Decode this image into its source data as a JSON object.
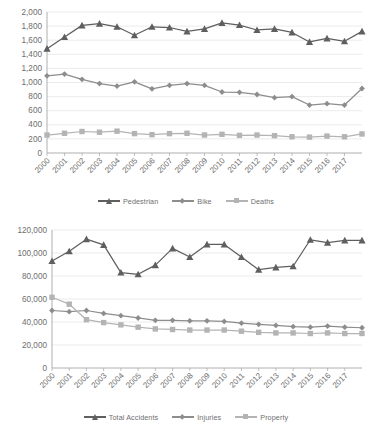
{
  "colors": {
    "series_dark": "#5f5f5f",
    "series_mid": "#8d8d8d",
    "series_light": "#b4b4b4",
    "axis": "#a6a6a6",
    "grid": "#e3e3e3",
    "text": "#6e6e6e",
    "background": "#ffffff"
  },
  "chart_data": [
    {
      "id": "traffic-fatalities-chart",
      "type": "line",
      "title": "",
      "xlabel": "",
      "ylabel": "",
      "grid": true,
      "legend_position": "bottom",
      "ylim": [
        0,
        2000
      ],
      "yticks": [
        0,
        200,
        400,
        600,
        800,
        1000,
        1200,
        1400,
        1600,
        1800,
        2000
      ],
      "ytick_labels": [
        "0",
        "200",
        "400",
        "600",
        "800",
        "1,000",
        "1,200",
        "1,400",
        "1,600",
        "1,800",
        "2,000"
      ],
      "categories": [
        "2000",
        "2001",
        "2002",
        "2003",
        "2004",
        "2005",
        "2006",
        "2007",
        "2008",
        "2009",
        "2010",
        "2011",
        "2012",
        "2013",
        "2014",
        "2015",
        "2016",
        "2017",
        ""
      ],
      "tick_labels": [
        "2000",
        "2001",
        "2002",
        "2003",
        "2004",
        "2005",
        "2006",
        "2007",
        "2008",
        "2009",
        "2010",
        "2011",
        "2012",
        "2013",
        "2014",
        "2015",
        "2016",
        "2017"
      ],
      "series": [
        {
          "name": "Pedestrian",
          "marker": "triangle",
          "color": "#5f5f5f",
          "values": [
            1480,
            1645,
            1810,
            1835,
            1790,
            1670,
            1790,
            1780,
            1725,
            1760,
            1845,
            1815,
            1745,
            1760,
            1710,
            1575,
            1625,
            1585,
            1725
          ]
        },
        {
          "name": "Bike",
          "marker": "diamond",
          "color": "#8d8d8d",
          "values": [
            1095,
            1120,
            1045,
            985,
            950,
            1010,
            910,
            960,
            985,
            960,
            865,
            860,
            830,
            785,
            800,
            680,
            700,
            680,
            915
          ]
        },
        {
          "name": "Deaths",
          "marker": "square",
          "color": "#b4b4b4",
          "values": [
            255,
            280,
            305,
            295,
            310,
            275,
            260,
            275,
            280,
            255,
            265,
            250,
            255,
            245,
            230,
            225,
            240,
            230,
            270
          ]
        }
      ]
    },
    {
      "id": "total-accidents-chart",
      "type": "line",
      "title": "",
      "xlabel": "",
      "ylabel": "",
      "grid": true,
      "legend_position": "bottom",
      "ylim": [
        0,
        120000
      ],
      "yticks": [
        0,
        20000,
        40000,
        60000,
        80000,
        100000,
        120000
      ],
      "ytick_labels": [
        "0",
        "20,000",
        "40,000",
        "60,000",
        "80,000",
        "100,000",
        "120,000"
      ],
      "categories": [
        "2000",
        "2001",
        "2002",
        "2003",
        "2004",
        "2005",
        "2006",
        "2007",
        "2008",
        "2009",
        "2010",
        "2011",
        "2012",
        "2013",
        "2014",
        "2015",
        "2016",
        "2017",
        ""
      ],
      "tick_labels": [
        "2000",
        "2001",
        "2002",
        "2003",
        "2004",
        "2005",
        "2006",
        "2007",
        "2008",
        "2009",
        "2010",
        "2011",
        "2012",
        "2013",
        "2014",
        "2015",
        "2016",
        "2017"
      ],
      "series": [
        {
          "name": "Total Accidents",
          "marker": "triangle",
          "color": "#5f5f5f",
          "values": [
            93000,
            101500,
            112000,
            107000,
            83000,
            81500,
            89500,
            104000,
            96500,
            107500,
            107500,
            96500,
            85500,
            87500,
            88500,
            111500,
            109000,
            111000,
            111000
          ]
        },
        {
          "name": "Injuries",
          "marker": "diamond",
          "color": "#8d8d8d",
          "values": [
            50000,
            49000,
            50000,
            47500,
            45500,
            43500,
            41500,
            41500,
            41000,
            41000,
            40500,
            39000,
            38000,
            37000,
            36000,
            35500,
            36500,
            35500,
            35000
          ]
        },
        {
          "name": "Property",
          "marker": "square",
          "color": "#b4b4b4",
          "values": [
            61500,
            55500,
            42000,
            39500,
            37500,
            35500,
            34000,
            33500,
            33000,
            33000,
            33000,
            32000,
            31000,
            30500,
            30500,
            30000,
            30500,
            30000,
            30000
          ]
        }
      ]
    }
  ],
  "charts": {
    "top": {
      "legend": [
        {
          "label": "Pedestrian",
          "marker": "triangle",
          "color": "#5f5f5f"
        },
        {
          "label": "Bike",
          "marker": "diamond",
          "color": "#8d8d8d"
        },
        {
          "label": "Deaths",
          "marker": "square",
          "color": "#b4b4b4"
        }
      ]
    },
    "bottom": {
      "legend": [
        {
          "label": "Total Accidents",
          "marker": "triangle",
          "color": "#5f5f5f"
        },
        {
          "label": "Injuries",
          "marker": "diamond",
          "color": "#8d8d8d"
        },
        {
          "label": "Property",
          "marker": "square",
          "color": "#b4b4b4"
        }
      ]
    }
  }
}
